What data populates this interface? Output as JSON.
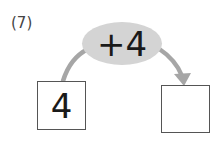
{
  "problem": {
    "label": "(7)",
    "operation": "+4",
    "start_value": "4",
    "result_value": ""
  },
  "colors": {
    "ellipse_fill": "#d4d4d4",
    "arrow": "#a6a6a6",
    "box_border": "#555555",
    "text": "#1a1a1a"
  }
}
